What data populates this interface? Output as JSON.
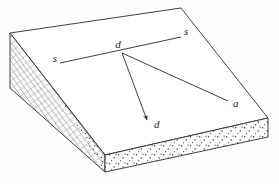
{
  "figure": {
    "background_color": "#fdfdfb",
    "line_color": "#2b2b2b",
    "top_face_color": "#ffffff",
    "front_face_color": "#fbfbf8",
    "left_face_color": "#f7f7f4",
    "stipple_color": "#3a3a3a",
    "hatch_color": "#9a9a9a"
  },
  "labels": {
    "strike_left": "s",
    "strike_right": "s",
    "dip_origin": "d",
    "dip_arrow": "d",
    "apparent_dip": "a"
  },
  "geometry": {
    "top_face": "10,33 181,8 268,118 105,155",
    "left_face": "10,33 10,88 105,172 105,155",
    "front_face": "105,155 268,118 268,137 105,172",
    "strike_line": "60,63 181,37",
    "dip_vertex": "122,53",
    "dip_arrow_end": "148,123",
    "apparent_dip_end": "228,101"
  },
  "annotations": {
    "strike_line_label": "strike line s-s",
    "dip_label": "true dip direction d",
    "apparent_dip_label": "apparent dip direction a"
  }
}
